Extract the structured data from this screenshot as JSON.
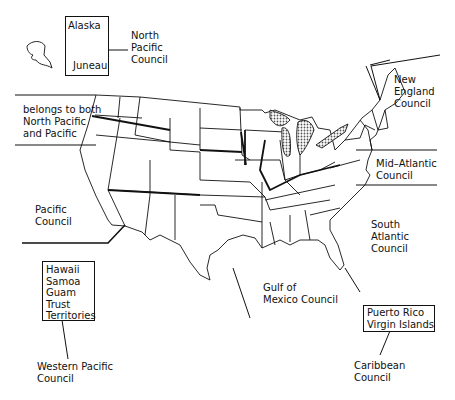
{
  "figure": {
    "type": "map"
  },
  "alaska_box": {
    "title": "Alaska",
    "city": "Juneau"
  },
  "labels": {
    "north_pacific": "North\nPacific\nCouncil",
    "new_england": "New\nEngland\nCouncil",
    "belongs_both": "belongs to both\nNorth Pacific\nand Pacific",
    "mid_atlantic": "Mid–Atlantic\nCouncil",
    "pacific": "Pacific\nCouncil",
    "south_atlantic": "South\nAtlantic\nCouncil",
    "gulf": "Gulf of\nMexico Council",
    "western_pacific": "Western Pacific\nCouncil",
    "caribbean": "Caribbean\nCouncil"
  },
  "western_pacific_box": {
    "text": "Hawaii\nSamoa\nGuam\nTrust\nTerritories"
  },
  "caribbean_box": {
    "text": "Puerto Rico\nVirgin Islands"
  },
  "colors": {
    "ink": "#111111",
    "background": "#ffffff",
    "lakes_fill": "#bbbbbb"
  }
}
